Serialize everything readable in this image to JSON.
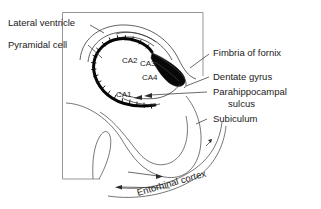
{
  "figure": {
    "background_color": "#ffffff",
    "ink_color": "#1a1a1a",
    "frame_color": "#8a8a8a",
    "pyramidal_layer_color": "#050505"
  },
  "labels": {
    "lateral_ventricle": "Lateral ventricle",
    "pyramidal_cell": "Pyramidal cell",
    "fimbria_of_fornix": "Fimbria of fornix",
    "dentate_gyrus": "Dentate gyrus",
    "parahippocampal_sulcus_line1": "Parahippocampal",
    "parahippocampal_sulcus_line2": "sulcus",
    "subiculum": "Subiculum",
    "entorhinal_cortex": "Entorhinal cortex"
  },
  "subfields": {
    "ca1": "CA1",
    "ca2": "CA2",
    "ca3": "CA3",
    "ca4": "CA4"
  }
}
